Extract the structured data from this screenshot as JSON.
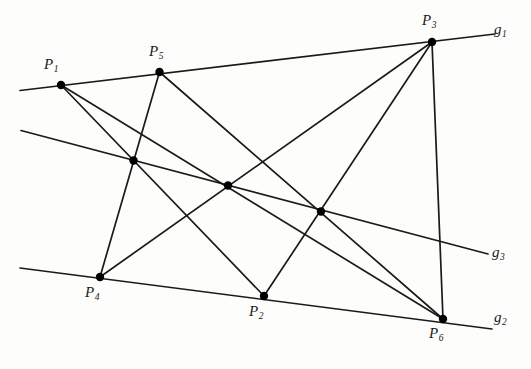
{
  "figure": {
    "background_color": "#fdfdfb",
    "stroke_color": "#1a1a1a",
    "point_color": "#000000",
    "label_color": "#1a1a1a"
  },
  "points": [
    {
      "id": "P1",
      "base": "P",
      "sub": "1",
      "x": 61,
      "y": 85,
      "label_x": 44,
      "label_y": 57,
      "labeled": true
    },
    {
      "id": "P5",
      "base": "P",
      "sub": "5",
      "x": 159.5,
      "y": 72,
      "label_x": 149,
      "label_y": 44,
      "labeled": true
    },
    {
      "id": "P3",
      "base": "P",
      "sub": "3",
      "x": 432,
      "y": 42,
      "label_x": 422,
      "label_y": 13,
      "labeled": true
    },
    {
      "id": "P4",
      "base": "P",
      "sub": "4",
      "x": 100,
      "y": 277,
      "label_x": 85,
      "label_y": 285,
      "labeled": true
    },
    {
      "id": "P2",
      "base": "P",
      "sub": "2",
      "x": 264,
      "y": 296,
      "label_x": 249,
      "label_y": 304,
      "labeled": true
    },
    {
      "id": "P6",
      "base": "P",
      "sub": "6",
      "x": 443,
      "y": 319,
      "label_x": 429,
      "label_y": 326,
      "labeled": true
    },
    {
      "id": "I1",
      "base": "",
      "sub": "",
      "x": 133.5,
      "y": 160.5,
      "label_x": 0,
      "label_y": 0,
      "labeled": false
    },
    {
      "id": "I2",
      "base": "",
      "sub": "",
      "x": 228,
      "y": 185.5,
      "label_x": 0,
      "label_y": 0,
      "labeled": false
    },
    {
      "id": "I3",
      "base": "",
      "sub": "",
      "x": 321,
      "y": 211.5,
      "label_x": 0,
      "label_y": 0,
      "labeled": false
    }
  ],
  "lines": [
    {
      "id": "g1",
      "base": "g",
      "sub": "1",
      "x1": 20,
      "y1": 90.5,
      "x2": 495,
      "y2": 34,
      "label_x": 494,
      "label_y": 22,
      "labeled": true
    },
    {
      "id": "g3",
      "base": "g",
      "sub": "3",
      "x1": 21,
      "y1": 130.5,
      "x2": 488,
      "y2": 254,
      "label_x": 492,
      "label_y": 245,
      "labeled": true
    },
    {
      "id": "g2",
      "base": "g",
      "sub": "2",
      "x1": 20,
      "y1": 268,
      "x2": 492,
      "y2": 329,
      "label_x": 494,
      "label_y": 310,
      "labeled": true
    }
  ],
  "connectors": [
    {
      "id": "c1",
      "from": "P1",
      "to": "P2"
    },
    {
      "id": "c2",
      "from": "P1",
      "to": "P6"
    },
    {
      "id": "c3",
      "from": "P5",
      "to": "P4"
    },
    {
      "id": "c4",
      "from": "P5",
      "to": "P6"
    },
    {
      "id": "c5",
      "from": "P3",
      "to": "P4"
    },
    {
      "id": "c6",
      "from": "P3",
      "to": "P2"
    },
    {
      "id": "c7",
      "from": "P3",
      "to": "P6"
    }
  ],
  "geometry": {
    "point_radius": 4.2,
    "line_width": 1.7,
    "connector_width": 1.7,
    "width": 531,
    "height": 369
  }
}
